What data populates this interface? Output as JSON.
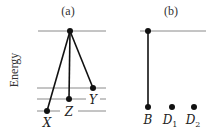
{
  "axis": {
    "ylabel": "Energy"
  },
  "panels": [
    {
      "id": "a",
      "title": "(a)",
      "levels_y": [
        31,
        88,
        99,
        111
      ],
      "top_state": {
        "x": 70,
        "y": 31
      },
      "states": [
        {
          "label": "X",
          "x": 47,
          "y": 111,
          "label_x": 44,
          "label_y": 128
        },
        {
          "label": "Z",
          "x": 69,
          "y": 99,
          "label_x": 65,
          "label_y": 116
        },
        {
          "label": "Y",
          "x": 93,
          "y": 88,
          "label_x": 90,
          "label_y": 104
        }
      ]
    },
    {
      "id": "b",
      "title": "(b)",
      "levels_y": [
        31
      ],
      "top_state": {
        "x": 148,
        "y": 31
      },
      "states": [
        {
          "label": "B",
          "x": 148,
          "y": 107,
          "connected": true
        },
        {
          "label": "D",
          "sub": "1",
          "x": 172,
          "y": 107,
          "connected": false
        },
        {
          "label": "D",
          "sub": "2",
          "x": 194,
          "y": 107,
          "connected": false
        }
      ]
    }
  ]
}
